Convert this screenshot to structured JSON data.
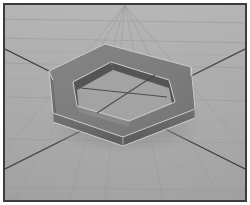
{
  "window": {
    "title": "3D Hexagonal Ring Render",
    "width": 250,
    "height": 205
  },
  "frame": {
    "border_color": "#3c3c3c",
    "border_width_px": 2,
    "outer_margin_color": "#ffffff"
  },
  "scene": {
    "name": "3d-viewport",
    "description": "Shaded 3D render of a hollow hexagonal ring resting on a tiled ground plane",
    "ground": {
      "base_color": "#ababab",
      "tile_line_color": "#9a9a9a",
      "guide_line_color": "#3a3a3a",
      "horizon_tint": "#b4b4b4"
    },
    "object": {
      "name": "hexagonal-ring",
      "shape": "hexagonal annulus prism",
      "sides": 6,
      "top_face_color": "#7a7a7a",
      "outer_wall_light_color": "#6e6e6e",
      "outer_wall_dark_color": "#565656",
      "inner_wall_color": "#4e4e4e",
      "inner_floor_color": "#9f9f9f",
      "edge_highlight_color": "#d8d8d8",
      "shadow_color": "#8e8e8e"
    },
    "guides": [
      {
        "name": "guide-line-nw-se",
        "from": [
          6,
          48
        ],
        "to": [
          246,
          170
        ]
      },
      {
        "name": "guide-line-sw-ne",
        "from": [
          6,
          170
        ],
        "to": [
          246,
          48
        ]
      }
    ]
  },
  "chart_data": {
    "type": "scatter",
    "xlabel": "",
    "ylabel": "",
    "categories": [
      "top-apex",
      "upper-left",
      "lower-left",
      "bottom-apex",
      "lower-right",
      "upper-right"
    ],
    "values": [
      49,
      71,
      110,
      134,
      112,
      72
    ],
    "series": [
      {
        "name": "outer-hexagon-x",
        "values": [
          116,
          56,
          58,
          131,
          199,
          196
        ]
      },
      {
        "name": "outer-hexagon-y",
        "values": [
          45,
          72,
          113,
          134,
          110,
          68
        ]
      },
      {
        "name": "inner-hexagon-x",
        "values": [
          116,
          78,
          80,
          131,
          178,
          175
        ]
      },
      {
        "name": "inner-hexagon-y",
        "values": [
          60,
          80,
          104,
          119,
          101,
          79
        ]
      }
    ]
  }
}
